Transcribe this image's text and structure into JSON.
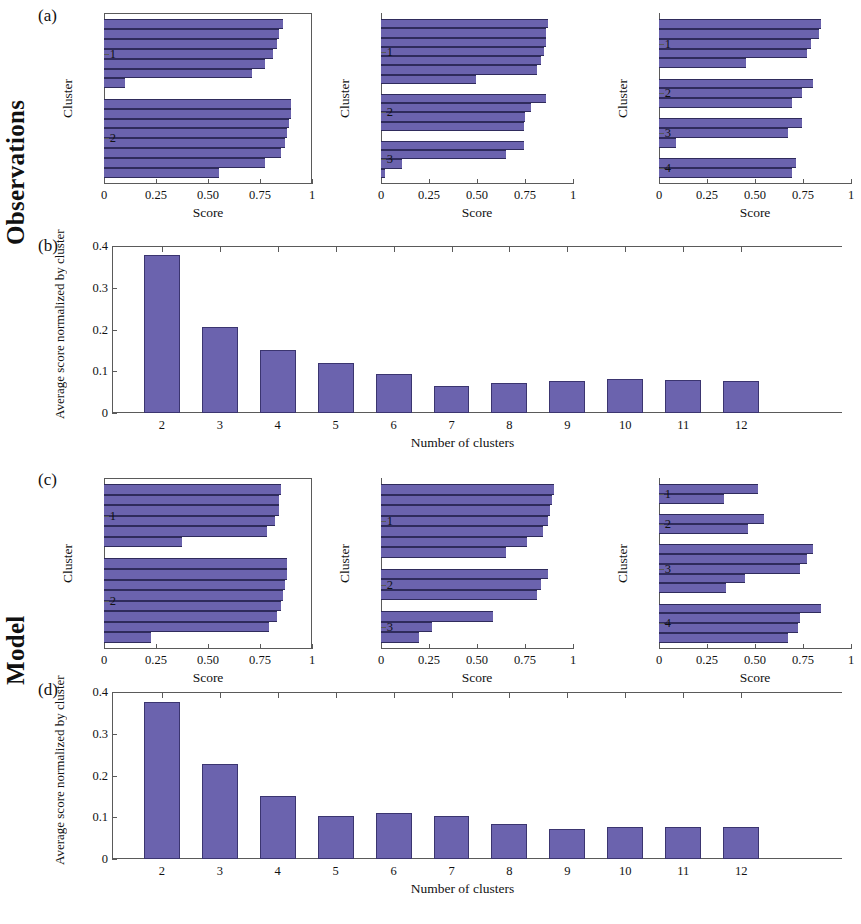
{
  "figure": {
    "row_labels": [
      {
        "text": "Observations"
      },
      {
        "text": "Model"
      }
    ],
    "panel_letters": [
      "(a)",
      "(b)",
      "(c)",
      "(d)"
    ]
  },
  "chart_data": [
    {
      "id": "a1",
      "type": "bar",
      "orientation": "horizontal",
      "title": "",
      "xlabel": "Score",
      "ylabel": "Cluster",
      "xlim": [
        0,
        1
      ],
      "xticks": [
        0,
        0.25,
        0.5,
        0.75,
        1
      ],
      "xticklabels": [
        "0",
        "0.25",
        "0.50",
        "0.75",
        "1"
      ],
      "yticklabels": [
        "1",
        "2"
      ],
      "grid": false,
      "clusters": [
        {
          "label": "1",
          "values": [
            0.87,
            0.85,
            0.84,
            0.82,
            0.78,
            0.72,
            0.1
          ]
        },
        {
          "label": "2",
          "values": [
            0.91,
            0.91,
            0.9,
            0.89,
            0.88,
            0.86,
            0.78,
            0.56
          ]
        }
      ]
    },
    {
      "id": "a2",
      "type": "bar",
      "orientation": "horizontal",
      "title": "",
      "xlabel": "Score",
      "ylabel": "Cluster",
      "xlim": [
        0,
        1
      ],
      "xticks": [
        0,
        0.25,
        0.5,
        0.75,
        1
      ],
      "xticklabels": [
        "0",
        "0.25",
        "0.50",
        "0.75",
        "1"
      ],
      "yticklabels": [
        "1",
        "2",
        "3"
      ],
      "grid": false,
      "clusters": [
        {
          "label": "1",
          "values": [
            0.88,
            0.87,
            0.87,
            0.86,
            0.84,
            0.82,
            0.5
          ]
        },
        {
          "label": "2",
          "values": [
            0.87,
            0.79,
            0.76,
            0.75
          ]
        },
        {
          "label": "3",
          "values": [
            0.75,
            0.66,
            0.11,
            0.02
          ]
        }
      ]
    },
    {
      "id": "a3",
      "type": "bar",
      "orientation": "horizontal",
      "title": "",
      "xlabel": "Score",
      "ylabel": "Cluster",
      "xlim": [
        0,
        1
      ],
      "xticks": [
        0,
        0.25,
        0.5,
        0.75,
        1
      ],
      "xticklabels": [
        "0",
        "0.25",
        "0.50",
        "0.75",
        "1"
      ],
      "yticklabels": [
        "1",
        "2",
        "3",
        "4"
      ],
      "grid": false,
      "clusters": [
        {
          "label": "1",
          "values": [
            0.85,
            0.84,
            0.8,
            0.78,
            0.46
          ]
        },
        {
          "label": "2",
          "values": [
            0.81,
            0.75,
            0.7
          ]
        },
        {
          "label": "3",
          "values": [
            0.75,
            0.68,
            0.09
          ]
        },
        {
          "label": "4",
          "values": [
            0.72,
            0.7
          ]
        }
      ]
    },
    {
      "id": "b",
      "type": "bar",
      "orientation": "vertical",
      "title": "",
      "xlabel": "Number of clusters",
      "ylabel": "Average score normalized by cluster",
      "categories": [
        "2",
        "3",
        "4",
        "5",
        "6",
        "7",
        "8",
        "9",
        "10",
        "11",
        "12"
      ],
      "values": [
        0.378,
        0.207,
        0.151,
        0.119,
        0.093,
        0.064,
        0.071,
        0.076,
        0.081,
        0.08,
        0.077
      ],
      "ylim": [
        0,
        0.4
      ],
      "yticks": [
        0,
        0.1,
        0.2,
        0.3,
        0.4
      ],
      "yticklabels": [
        "0",
        "0.1",
        "0.2",
        "0.3",
        "0.4"
      ],
      "grid": false
    },
    {
      "id": "c1",
      "type": "bar",
      "orientation": "horizontal",
      "title": "",
      "xlabel": "Score",
      "ylabel": "Cluster",
      "xlim": [
        0,
        1
      ],
      "xticks": [
        0,
        0.25,
        0.5,
        0.75,
        1
      ],
      "xticklabels": [
        "0",
        "0.25",
        "0.50",
        "0.75",
        "1"
      ],
      "yticklabels": [
        "1",
        "2"
      ],
      "grid": false,
      "clusters": [
        {
          "label": "1",
          "values": [
            0.86,
            0.85,
            0.85,
            0.83,
            0.79,
            0.38
          ]
        },
        {
          "label": "2",
          "values": [
            0.89,
            0.89,
            0.88,
            0.87,
            0.86,
            0.84,
            0.8,
            0.23
          ]
        }
      ]
    },
    {
      "id": "c2",
      "type": "bar",
      "orientation": "horizontal",
      "title": "",
      "xlabel": "Score",
      "ylabel": "Cluster",
      "xlim": [
        0,
        1
      ],
      "xticks": [
        0,
        0.25,
        0.5,
        0.75,
        1
      ],
      "xticklabels": [
        "0",
        "0.25",
        "0.50",
        "0.75",
        "1"
      ],
      "yticklabels": [
        "1",
        "2",
        "3"
      ],
      "grid": false,
      "clusters": [
        {
          "label": "1",
          "values": [
            0.91,
            0.9,
            0.89,
            0.88,
            0.85,
            0.77,
            0.66
          ]
        },
        {
          "label": "2",
          "values": [
            0.88,
            0.84,
            0.82
          ]
        },
        {
          "label": "3",
          "values": [
            0.59,
            0.27,
            0.2
          ]
        }
      ]
    },
    {
      "id": "c3",
      "type": "bar",
      "orientation": "horizontal",
      "title": "",
      "xlabel": "Score",
      "ylabel": "Cluster",
      "xlim": [
        0,
        1
      ],
      "xticks": [
        0,
        0.25,
        0.5,
        0.75,
        1
      ],
      "xticklabels": [
        "0",
        "0.25",
        "0.50",
        "0.75",
        "1"
      ],
      "yticklabels": [
        "1",
        "2",
        "3",
        "4"
      ],
      "grid": false,
      "clusters": [
        {
          "label": "1",
          "values": [
            0.52,
            0.34
          ]
        },
        {
          "label": "2",
          "values": [
            0.55,
            0.47
          ]
        },
        {
          "label": "3",
          "values": [
            0.81,
            0.78,
            0.74,
            0.45,
            0.35
          ]
        },
        {
          "label": "4",
          "values": [
            0.85,
            0.74,
            0.73,
            0.68
          ]
        }
      ]
    },
    {
      "id": "d",
      "type": "bar",
      "orientation": "vertical",
      "title": "",
      "xlabel": "Number of clusters",
      "ylabel": "Average score normalized by cluster",
      "categories": [
        "2",
        "3",
        "4",
        "5",
        "6",
        "7",
        "8",
        "9",
        "10",
        "11",
        "12"
      ],
      "values": [
        0.375,
        0.227,
        0.15,
        0.104,
        0.11,
        0.104,
        0.085,
        0.072,
        0.076,
        0.077,
        0.077
      ],
      "ylim": [
        0,
        0.4
      ],
      "yticks": [
        0,
        0.1,
        0.2,
        0.3,
        0.4
      ],
      "yticklabels": [
        "0",
        "0.1",
        "0.2",
        "0.3",
        "0.4"
      ],
      "grid": false
    }
  ],
  "style": {
    "bar_color": "#6b63ae",
    "bar_edge_color": "#2f2b5c",
    "axis_color": "#5a5a5a",
    "text_color": "#111111"
  }
}
